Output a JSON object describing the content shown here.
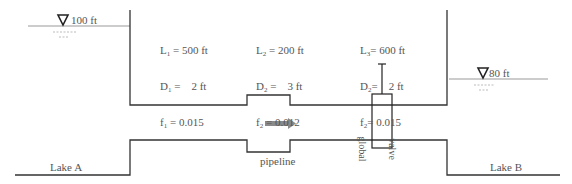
{
  "diagram": {
    "lake_a": {
      "label": "Lake A",
      "elevation": "100 ft"
    },
    "lake_b": {
      "label": "Lake B",
      "elevation": "80 ft"
    },
    "pipeline_label": "pipeline",
    "valve_label_line1": "global",
    "valve_label_line2": "valve",
    "segments": [
      {
        "L": "L",
        "L_sub": "1",
        "L_val": " = 500 ft",
        "D": "D",
        "D_sub": "1",
        "D_val": " =    2 ft",
        "f": "f",
        "f_sub": "1",
        "f_val": " = 0.015"
      },
      {
        "L": "L",
        "L_sub": "2",
        "L_val": " = 200 ft",
        "D": "D",
        "D_sub": "2",
        "D_val": " =    3 ft",
        "f": "f",
        "f_sub": "2",
        "f_val": " = 0.012"
      },
      {
        "L": "L",
        "L_sub": "3",
        "L_val": "= 600 ft",
        "D": "D",
        "D_sub": "2",
        "D_val": "=    2 ft",
        "f": "f",
        "f_sub": "2",
        "f_val": "= 0.015"
      }
    ],
    "colors": {
      "line": "#333333",
      "water": "#999999",
      "arrow": "#8a8a8a",
      "text": "#555555"
    }
  }
}
